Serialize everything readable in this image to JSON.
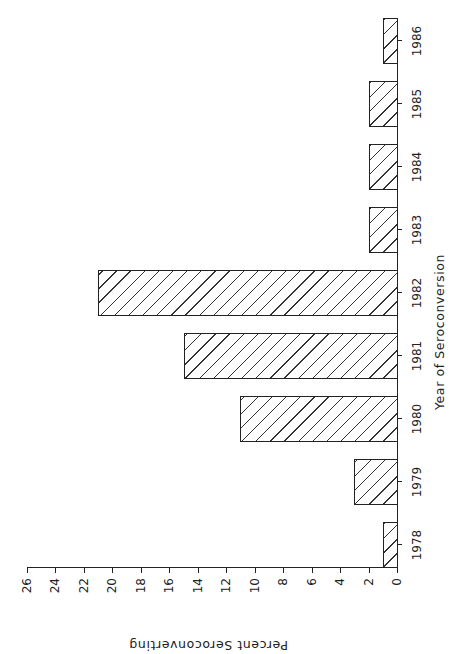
{
  "chart_data": {
    "type": "bar",
    "title": "",
    "xlabel": "Year of Seroconversion",
    "ylabel": "Percent Seroconverting",
    "categories": [
      "1978",
      "1979",
      "1980",
      "1981",
      "1982",
      "1983",
      "1984",
      "1985",
      "1986"
    ],
    "values": [
      1,
      3,
      11,
      15,
      21,
      2,
      2,
      2,
      1
    ],
    "ylim": [
      0,
      26
    ],
    "yticks": [
      "0",
      "2",
      "4",
      "6",
      "8",
      "10",
      "12",
      "14",
      "16",
      "18",
      "20",
      "22",
      "24",
      "26"
    ],
    "grid": false,
    "legend": null,
    "bar_fill": "diagonal-hatch",
    "orientation_note": "figure rotated 90 degrees counter-clockwise on page",
    "colors": {
      "ink": "#222222",
      "background": "#ffffff"
    }
  }
}
